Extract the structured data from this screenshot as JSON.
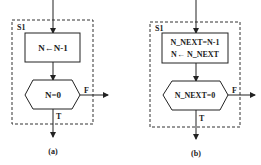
{
  "diagrams": [
    {
      "id": "a",
      "caption": "(a)",
      "group_label": "S1",
      "process_lines": [
        "N←N-1"
      ],
      "decision": "N=0",
      "false_label": "F",
      "true_label": "T"
    },
    {
      "id": "b",
      "caption": "(b)",
      "group_label": "S1",
      "process_lines": [
        "N_NEXT=N-1",
        "N← N_NEXT"
      ],
      "decision": "N_NEXT=0",
      "false_label": "F",
      "true_label": "T"
    }
  ],
  "colors": {
    "stroke": "#222222",
    "background": "#ffffff"
  }
}
